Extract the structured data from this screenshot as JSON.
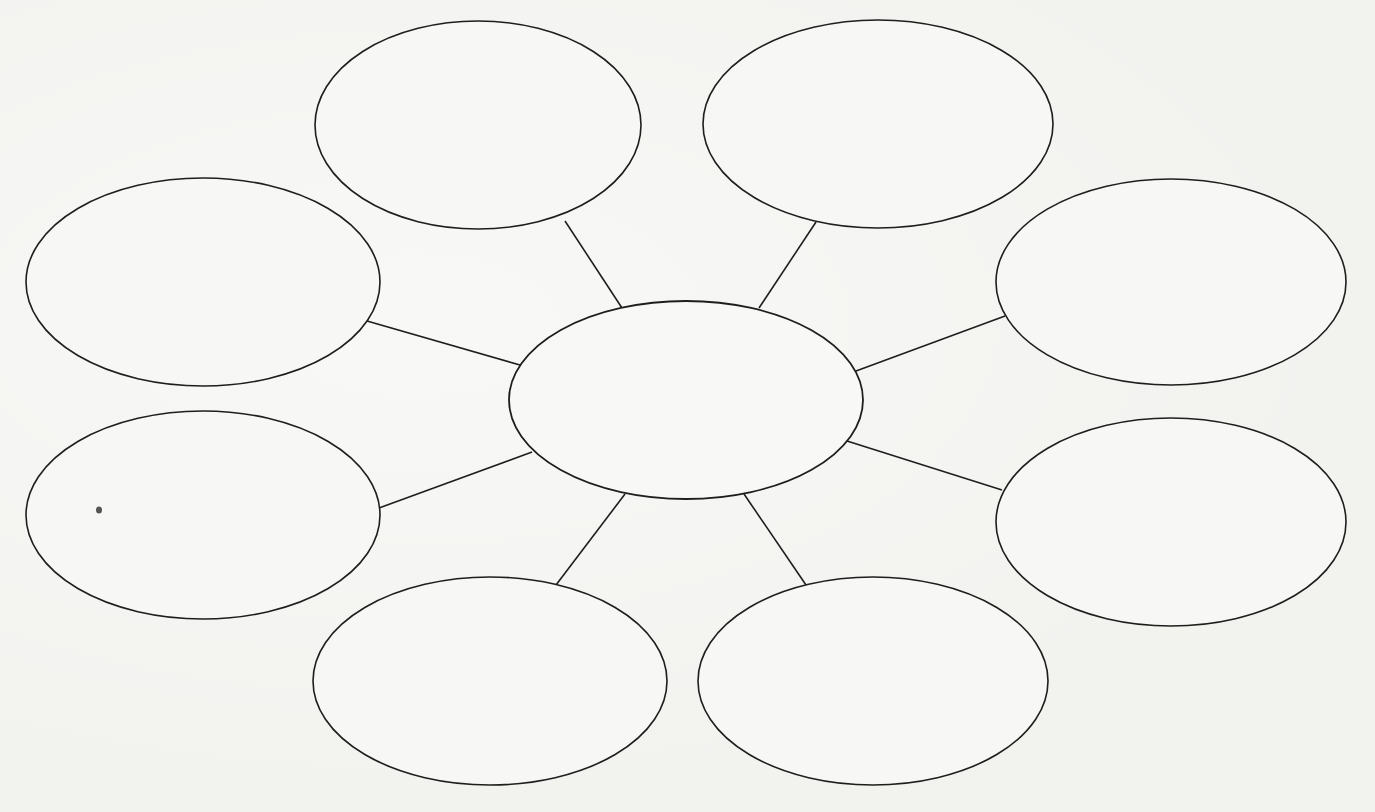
{
  "diagram": {
    "type": "bubble-map",
    "background_color": "#f2f2ef",
    "stroke_color": "#1e1e1e",
    "center": {
      "label": "",
      "cx": 686,
      "cy": 400,
      "rx": 177,
      "ry": 99
    },
    "bubbles": [
      {
        "id": "top-left",
        "label": "",
        "cx": 478,
        "cy": 125,
        "rx": 163,
        "ry": 104
      },
      {
        "id": "top-right",
        "label": "",
        "cx": 878,
        "cy": 124,
        "rx": 175,
        "ry": 104
      },
      {
        "id": "upper-left",
        "label": "",
        "cx": 203,
        "cy": 282,
        "rx": 177,
        "ry": 104
      },
      {
        "id": "upper-right",
        "label": "",
        "cx": 1171,
        "cy": 282,
        "rx": 175,
        "ry": 103
      },
      {
        "id": "lower-left",
        "label": "",
        "cx": 203,
        "cy": 515,
        "rx": 177,
        "ry": 104
      },
      {
        "id": "lower-right",
        "label": "",
        "cx": 1171,
        "cy": 522,
        "rx": 175,
        "ry": 104
      },
      {
        "id": "bottom-left",
        "label": "",
        "cx": 490,
        "cy": 681,
        "rx": 177,
        "ry": 104
      },
      {
        "id": "bottom-right",
        "label": "",
        "cx": 873,
        "cy": 681,
        "rx": 175,
        "ry": 104
      }
    ],
    "connectors": [
      {
        "to": "top-left",
        "x1": 622,
        "y1": 308,
        "x2": 565,
        "y2": 221
      },
      {
        "to": "top-right",
        "x1": 759,
        "y1": 308,
        "x2": 816,
        "y2": 222
      },
      {
        "to": "upper-left",
        "x1": 520,
        "y1": 365,
        "x2": 367,
        "y2": 321
      },
      {
        "to": "upper-right",
        "x1": 856,
        "y1": 371,
        "x2": 1005,
        "y2": 316
      },
      {
        "to": "lower-left",
        "x1": 532,
        "y1": 452,
        "x2": 379,
        "y2": 508
      },
      {
        "to": "lower-right",
        "x1": 847,
        "y1": 441,
        "x2": 1002,
        "y2": 490
      },
      {
        "to": "bottom-left",
        "x1": 625,
        "y1": 494,
        "x2": 556,
        "y2": 585
      },
      {
        "to": "bottom-right",
        "x1": 744,
        "y1": 494,
        "x2": 806,
        "y2": 585
      }
    ]
  }
}
